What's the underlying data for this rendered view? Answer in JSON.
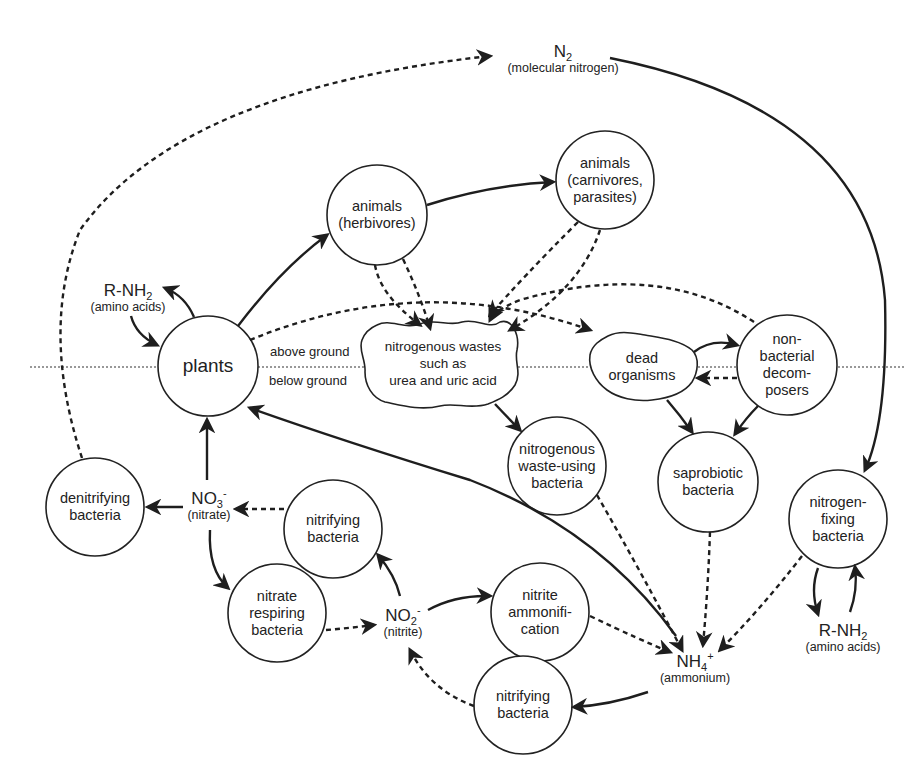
{
  "diagram": {
    "ground_labels": {
      "above": "above ground",
      "below": "below ground"
    },
    "chemicals": {
      "n2": {
        "formula": "N",
        "subscript": "2",
        "name": "(molecular nitrogen)"
      },
      "rnh2_plants": {
        "formula": "R-NH",
        "subscript": "2",
        "name": "(amino acids)"
      },
      "rnh2_fixers": {
        "formula": "R-NH",
        "subscript": "2",
        "name": "(amino acids)"
      },
      "no3": {
        "formula": "NO",
        "subscript": "3",
        "charge": "-",
        "name": "(nitrate)"
      },
      "no2": {
        "formula": "NO",
        "subscript": "2",
        "charge": "-",
        "name": "(nitrite)"
      },
      "nh4": {
        "formula": "NH",
        "subscript": "4",
        "charge": "+",
        "name": "(ammonium)"
      }
    },
    "nodes": {
      "plants": {
        "label": "plants"
      },
      "herbivores": {
        "line1": "animals",
        "line2": "(herbivores)"
      },
      "carnivores": {
        "line1": "animals",
        "line2": "(carnivores,",
        "line3": "parasites)"
      },
      "wastes": {
        "line1": "nitrogenous wastes",
        "line2": "such as",
        "line3": "urea and uric acid"
      },
      "dead": {
        "line1": "dead",
        "line2": "organisms"
      },
      "decomposers": {
        "line1": "non-",
        "line2": "bacterial",
        "line3": "decom-",
        "line4": "posers"
      },
      "waste_bacteria": {
        "line1": "nitrogenous",
        "line2": "waste-using",
        "line3": "bacteria"
      },
      "saprobiotic": {
        "line1": "saprobiotic",
        "line2": "bacteria"
      },
      "denitrifying": {
        "line1": "denitrifying",
        "line2": "bacteria"
      },
      "nitrifying_upper": {
        "line1": "nitrifying",
        "line2": "bacteria"
      },
      "nitrate_respiring": {
        "line1": "nitrate",
        "line2": "respiring",
        "line3": "bacteria"
      },
      "nitrite_ammonification": {
        "line1": "nitrite",
        "line2": "ammonifi-",
        "line3": "cation"
      },
      "nitrogen_fixing": {
        "line1": "nitrogen-",
        "line2": "fixing",
        "line3": "bacteria"
      },
      "nitrifying_lower": {
        "line1": "nitrifying",
        "line2": "bacteria"
      }
    },
    "legend": {
      "solid_arrow": "direct transfer",
      "dashed_arrow": "transfer via decomposition / excretion"
    }
  }
}
